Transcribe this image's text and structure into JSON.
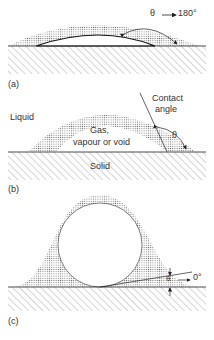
{
  "panels": [
    {
      "id": "a",
      "label": "(a)",
      "angle_annotation": "θ",
      "angle_arrow": "→",
      "angle_value": "180°"
    },
    {
      "id": "b",
      "label": "(b)",
      "liquid_label": "Liquid",
      "gas_label_line1": "Gas,",
      "gas_label_line2": "vapour or void",
      "solid_label": "Solid",
      "contact_label_line1": "Contact",
      "contact_label_line2": "angle",
      "angle_symbol": "θ"
    },
    {
      "id": "c",
      "label": "(c)",
      "angle_symbol": "θ",
      "angle_value": "0°"
    }
  ],
  "colors": {
    "stipple": "#9a9a9a",
    "line": "#222222",
    "hatch": "#777777"
  }
}
